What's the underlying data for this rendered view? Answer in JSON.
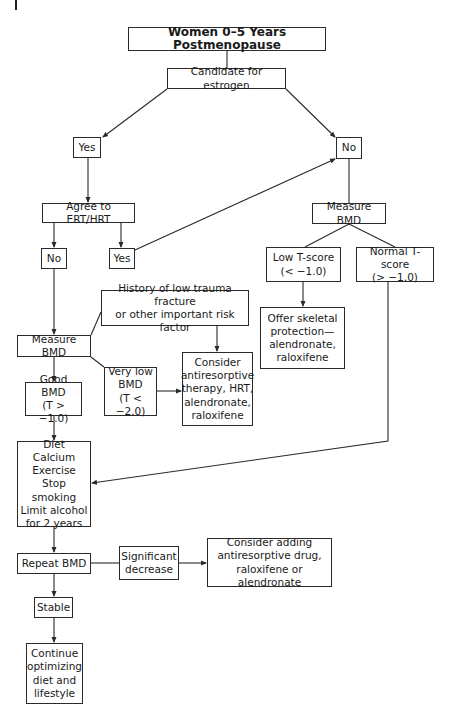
{
  "title": "Women 0–5 Years Postmenopause",
  "nodes": {
    "candidate": "Candidate for estrogen",
    "yes_1": "Yes",
    "no_1": "No",
    "agree": "Agree to ERT/HRT",
    "no_2": "No",
    "yes_2": "Yes",
    "measure_bmd_right": "Measure BMD",
    "low_tscore": "Low T-score\n(< −1.0)",
    "normal_tscore": "Normal T-score\n(> −1.0)",
    "offer_skeletal": "Offer skeletal\nprotection—\nalendronate,\nraloxifene",
    "history": "History of low trauma fracture\nor other important risk factor",
    "measure_bmd_left": "Measure BMD",
    "very_low_bmd": "Very low\nBMD\n(T < −2.0)",
    "consider_antiresorptive": "Consider\nantiresorptive\ntherapy, HRT,\nalendronate,\nraloxifene",
    "good_bmd": "Good BMD\n(T > −1.0)",
    "lifestyle": "Diet\nCalcium\nExercise\nStop smoking\nLimit alcohol\nfor 2 years",
    "repeat_bmd": "Repeat BMD",
    "significant_decrease": "Significant\ndecrease",
    "consider_adding": "Consider adding\nantiresorptive drug,\nraloxifene or alendronate",
    "stable": "Stable",
    "continue": "Continue\noptimizing\ndiet and\nlifestyle"
  },
  "colors": {
    "line": "#2a2a2a",
    "background": "#ffffff",
    "text": "#1a1a1a"
  }
}
